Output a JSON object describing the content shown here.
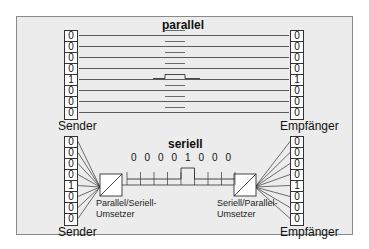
{
  "parallel": {
    "title": "parallel",
    "sender_label": "Sender",
    "receiver_label": "Empfänger",
    "sender_bits": [
      "0",
      "0",
      "0",
      "0",
      "1",
      "0",
      "0",
      "0"
    ],
    "receiver_bits": [
      "0",
      "0",
      "0",
      "0",
      "1",
      "0",
      "0",
      "0"
    ]
  },
  "serial": {
    "title": "seriell",
    "sender_label": "Sender",
    "receiver_label": "Empfänger",
    "sender_bits": [
      "0",
      "0",
      "0",
      "0",
      "1",
      "0",
      "0",
      "0"
    ],
    "receiver_bits": [
      "0",
      "0",
      "0",
      "0",
      "1",
      "0",
      "0",
      "0"
    ],
    "stream_bits": [
      "0",
      "0",
      "0",
      "0",
      "1",
      "0",
      "0",
      "0"
    ],
    "converter_left": {
      "line1": "Parallel/Seriell-",
      "line2": "Umsetzer"
    },
    "converter_right": {
      "line1": "Seriell/Parallel-",
      "line2": "Umsetzer"
    }
  },
  "colors": {
    "frame_bg": "#ececec",
    "frame_border": "#8a8a8a",
    "line": "#333333"
  }
}
